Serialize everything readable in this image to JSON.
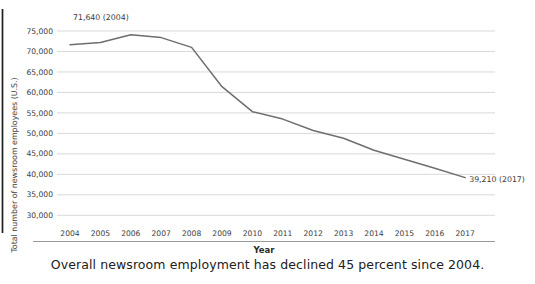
{
  "caption": {
    "text": "Overall newsroom employment has declined 45 percent since 2004."
  },
  "chart_data": {
    "type": "line",
    "title": "",
    "xlabel": "Year",
    "ylabel": "Total number of newsroom  employees (U.S.)",
    "x": [
      2004,
      2005,
      2006,
      2007,
      2008,
      2009,
      2010,
      2011,
      2012,
      2013,
      2014,
      2015,
      2016,
      2017
    ],
    "values": [
      71640,
      72200,
      74100,
      73400,
      71000,
      61400,
      55300,
      53500,
      50700,
      48800,
      45900,
      43700,
      41500,
      39210
    ],
    "series_name": "Total newsroom employees",
    "ylim": [
      30000,
      75000
    ],
    "ytick_step": 5000,
    "grid": "horizontal",
    "legend": "none",
    "annotations": [
      {
        "text": "71,640 (2004)",
        "year": 2004,
        "value": 71640,
        "dx": 3,
        "dy": -25,
        "anchor": "start"
      },
      {
        "text": "39,210 (2017)",
        "year": 2017,
        "value": 39210,
        "dx": 4,
        "dy": 4,
        "anchor": "start"
      }
    ],
    "colors": {
      "line": "#6e6e6e",
      "grid": "#d9d9d9",
      "axis_line": "#1f1f1f",
      "frame_line": "#9a9a9a",
      "tick_text": "#3d3d3d",
      "annotation_text": "#3a3a3a"
    }
  }
}
